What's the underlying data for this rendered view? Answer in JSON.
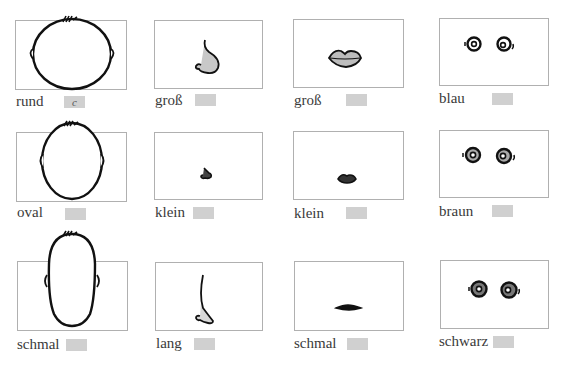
{
  "exercise": {
    "columns": [
      "Kopfform",
      "Nase",
      "Mund",
      "Augen"
    ],
    "rows": [
      {
        "cells": [
          {
            "label": "rund",
            "answer": "c",
            "icon": "round-face-icon"
          },
          {
            "label": "groß",
            "answer": "",
            "icon": "large-nose-icon"
          },
          {
            "label": "groß",
            "answer": "",
            "icon": "large-mouth-icon"
          },
          {
            "label": "blau",
            "answer": "",
            "icon": "blue-eyes-icon"
          }
        ]
      },
      {
        "cells": [
          {
            "label": "oval",
            "answer": "",
            "icon": "oval-face-icon"
          },
          {
            "label": "klein",
            "answer": "",
            "icon": "small-nose-icon"
          },
          {
            "label": "klein",
            "answer": "",
            "icon": "small-mouth-icon"
          },
          {
            "label": "braun",
            "answer": "",
            "icon": "brown-eyes-icon"
          }
        ]
      },
      {
        "cells": [
          {
            "label": "schmal",
            "answer": "",
            "icon": "narrow-face-icon"
          },
          {
            "label": "lang",
            "answer": "",
            "icon": "long-nose-icon"
          },
          {
            "label": "schmal",
            "answer": "",
            "icon": "thin-mouth-icon"
          },
          {
            "label": "schwarz",
            "answer": "",
            "icon": "black-eyes-icon"
          }
        ]
      }
    ]
  },
  "colors": {
    "box_border": "#b0b0b0",
    "answer_field": "#d0d0d0",
    "ink": "#111111",
    "shade": "#9a9a9a"
  }
}
